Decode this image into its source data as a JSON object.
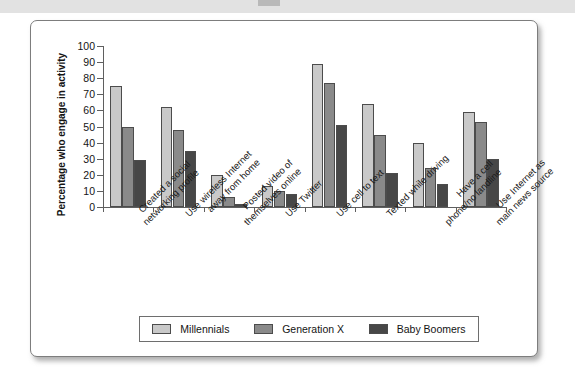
{
  "chart_data": {
    "type": "bar",
    "title": "",
    "xlabel": "",
    "ylabel": "Percentage who engage in activity",
    "ylim": [
      0,
      100
    ],
    "ytick_step": 10,
    "ytick_labels": [
      "100",
      "90",
      "80",
      "70",
      "60",
      "50",
      "40",
      "30",
      "20",
      "10",
      "0"
    ],
    "grid": false,
    "legend_position": "bottom",
    "categories": [
      "Created a social networking profile",
      "Use wireless Internet away from home",
      "Posted video of themselves online",
      "Use Twitter",
      "Use cell to text",
      "Texted while driving",
      "Have a cell phone/no landline",
      "Use Internet as main news source"
    ],
    "category_lines": [
      [
        "Created a social",
        "networking profile"
      ],
      [
        "Use wireless Internet",
        "away from home"
      ],
      [
        "Posted video of",
        "themselves online"
      ],
      [
        "Use Twitter"
      ],
      [
        "Use cell to text"
      ],
      [
        "Texted while driving"
      ],
      [
        "Have a cell",
        "phone/no landline"
      ],
      [
        "Use Internet as",
        "main news source"
      ]
    ],
    "series": [
      {
        "name": "Millennials",
        "color": "#c9c9c9",
        "values": [
          75,
          62,
          20,
          13,
          89,
          64,
          40,
          59
        ]
      },
      {
        "name": "Generation X",
        "color": "#8a8a8a",
        "values": [
          50,
          48,
          6,
          10,
          77,
          45,
          24,
          53
        ]
      },
      {
        "name": "Baby Boomers",
        "color": "#474747",
        "values": [
          29,
          35,
          2,
          8,
          51,
          21,
          14,
          30
        ]
      }
    ]
  },
  "legend": {
    "items": [
      {
        "label": "Millennials",
        "color": "#c9c9c9"
      },
      {
        "label": "Generation X",
        "color": "#8a8a8a"
      },
      {
        "label": "Baby Boomers",
        "color": "#474747"
      }
    ]
  }
}
